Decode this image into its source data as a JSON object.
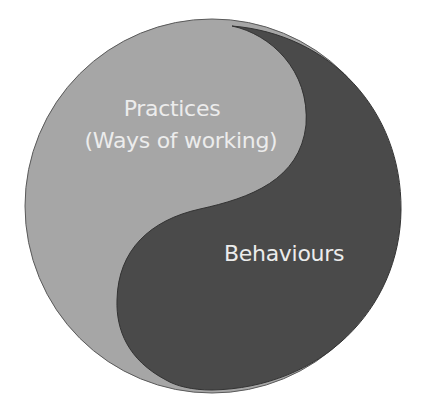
{
  "diagram": {
    "type": "yin-yang",
    "colors": {
      "background": "#ffffff",
      "light_half": "#a6a6a6",
      "dark_half": "#4a4a4a",
      "outline": "#3a3a3a",
      "text": "#ececec"
    },
    "halves": [
      {
        "id": "practices",
        "title": "Practices",
        "subtitle": "(Ways of working)",
        "shade": "light"
      },
      {
        "id": "behaviours",
        "title": "Behaviours",
        "shade": "dark"
      }
    ]
  }
}
